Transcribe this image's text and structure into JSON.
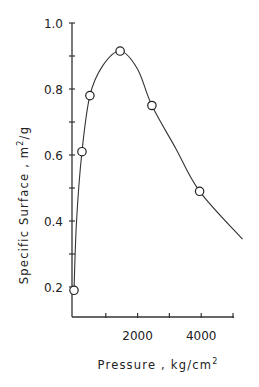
{
  "chart_data": {
    "type": "line",
    "title": "",
    "xlabel": "Pressure , kg/cm",
    "xlabel_superscript": "2",
    "ylabel": "Specific Surface , m",
    "ylabel_superscript": "2",
    "ylabel_suffix": "/g",
    "xlim": [
      0,
      5000
    ],
    "ylim": [
      0.2,
      1.0
    ],
    "x_ticks": [
      0,
      1000,
      2000,
      3000,
      4000,
      5000
    ],
    "x_tick_labels": [
      "",
      "",
      "2000",
      "",
      "4000",
      ""
    ],
    "y_ticks": [
      0.2,
      0.3,
      0.4,
      0.5,
      0.6,
      0.7,
      0.8,
      0.9,
      1.0
    ],
    "y_tick_labels": [
      "0.2",
      "",
      "0.4",
      "",
      "0.6",
      "",
      "0.8",
      "",
      "1.0"
    ],
    "grid": false,
    "legend": null,
    "series": [
      {
        "name": "measured",
        "marker": "open-circle",
        "x": [
          0,
          250,
          500,
          1450,
          2450,
          3950
        ],
        "y": [
          0.19,
          0.61,
          0.78,
          0.915,
          0.75,
          0.49
        ]
      }
    ],
    "fit_curve": {
      "x": [
        0,
        80,
        250,
        500,
        900,
        1450,
        2000,
        2450,
        3200,
        3950,
        5300
      ],
      "y": [
        0.19,
        0.4,
        0.61,
        0.78,
        0.87,
        0.915,
        0.86,
        0.75,
        0.62,
        0.49,
        0.345
      ]
    }
  }
}
